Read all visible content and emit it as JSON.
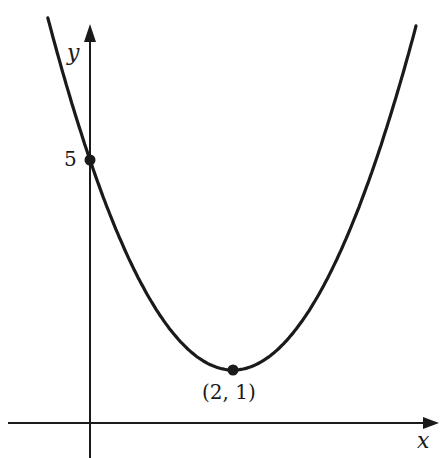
{
  "chart_data": {
    "type": "line",
    "title": "",
    "function": "y = (x - 2)^2 + 1",
    "xlabel": "x",
    "ylabel": "y",
    "series": [
      {
        "name": "parabola",
        "x": [
          -0.6,
          0,
          1,
          2,
          3,
          4,
          4.55
        ],
        "values": [
          7.76,
          5,
          2,
          1,
          2,
          5,
          7.5
        ]
      }
    ],
    "points": [
      {
        "x": 0,
        "y": 5,
        "label": "5"
      },
      {
        "x": 2,
        "y": 1,
        "label": "(2, 1)"
      }
    ],
    "grid": false,
    "legend": "none"
  },
  "labels": {
    "x_axis": "x",
    "y_axis": "y",
    "y_intercept": "5",
    "vertex": "(2, 1)"
  },
  "colors": {
    "ink": "#1a1a1a",
    "background": "#ffffff"
  }
}
